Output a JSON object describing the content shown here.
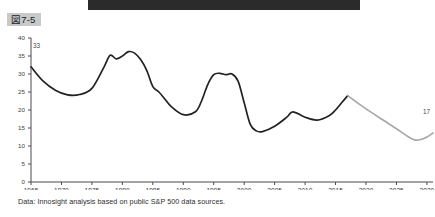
{
  "figure": {
    "tag_label": "図7-5",
    "banner_color": "#2b2b2b",
    "tag_bg_color": "#c9c9c9"
  },
  "caption": {
    "text": "Data: Innosight analysis based on public S&P 500 data sources."
  },
  "chart_data": {
    "type": "line",
    "title": "",
    "xlabel": "",
    "ylabel": "",
    "xlim": [
      1965,
      2031
    ],
    "ylim": [
      0,
      40
    ],
    "grid": false,
    "legend": "none",
    "x_ticks": [
      1965,
      1970,
      1975,
      1980,
      1985,
      1990,
      1995,
      2000,
      2005,
      2010,
      2015,
      2020,
      2025,
      2030
    ],
    "y_ticks": [
      0,
      5,
      10,
      15,
      20,
      25,
      30,
      35,
      40
    ],
    "annotations": [
      {
        "label": "33",
        "x": 1965,
        "y": 33
      },
      {
        "label": "17",
        "x": 2031,
        "y": 17
      }
    ],
    "series": [
      {
        "name": "Average company lifespan on S&P 500 index (years) — historical",
        "color": "#222222",
        "style": "solid",
        "x": [
          1965,
          1967,
          1969,
          1971,
          1973,
          1975,
          1977,
          1978,
          1979,
          1980,
          1981,
          1982,
          1983,
          1984,
          1985,
          1986,
          1987,
          1988,
          1990,
          1992,
          1993,
          1994,
          1995,
          1996,
          1997,
          1998,
          1999,
          2000,
          2001,
          2002,
          2003,
          2005,
          2007,
          2008,
          2010,
          2012,
          2014,
          2015,
          2016,
          2017
        ],
        "y": [
          32.0,
          28.0,
          25.5,
          24.2,
          24.3,
          26.0,
          32.0,
          35.2,
          34.2,
          35.0,
          36.2,
          35.8,
          34.0,
          31.0,
          26.5,
          25.0,
          23.0,
          21.0,
          18.7,
          19.5,
          22.5,
          27.0,
          29.8,
          30.2,
          29.8,
          30.0,
          28.0,
          22.0,
          16.0,
          14.2,
          14.0,
          15.5,
          18.0,
          19.5,
          18.0,
          17.2,
          18.5,
          20.0,
          22.0,
          24.0
        ]
      },
      {
        "name": "Average company lifespan on S&P 500 index (years) — projected",
        "color": "#a8a8a8",
        "style": "solid",
        "x": [
          2017,
          2019,
          2021,
          2023,
          2025,
          2027,
          2028,
          2029,
          2030,
          2031
        ],
        "y": [
          24.0,
          21.5,
          19.2,
          17.0,
          14.8,
          12.5,
          11.7,
          11.8,
          12.5,
          13.6
        ]
      }
    ]
  }
}
